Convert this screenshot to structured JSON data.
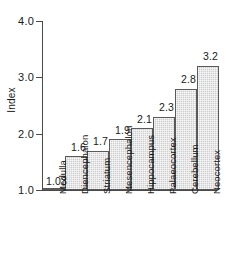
{
  "chart_data": {
    "type": "bar",
    "title": "",
    "xlabel": "",
    "ylabel": "Index",
    "categories": [
      "Medulla",
      "Diencephalon",
      "Striatum",
      "Mesencephalon",
      "Hippocampus",
      "Palaeocortex",
      "Cerebellum",
      "Neocortex"
    ],
    "values": [
      1.03,
      1.6,
      1.7,
      1.9,
      2.1,
      2.3,
      2.8,
      3.2
    ],
    "value_labels": [
      "1.03",
      "1.6",
      "1.7",
      "1.9",
      "2.1",
      "2.3",
      "2.8",
      "3.2"
    ],
    "ylim": [
      1.0,
      4.0
    ],
    "ytick_values": [
      1.0,
      2.0,
      3.0,
      4.0
    ],
    "ytick_labels": [
      "1.0",
      "2.0",
      "3.0",
      "4.0"
    ],
    "grid": false,
    "legend": null,
    "bar_fill_color": "#cfcfcf",
    "bar_edge_color": "#5a5a5a",
    "axis_color": "#4a4a4a",
    "background_color": "#ffffff"
  }
}
